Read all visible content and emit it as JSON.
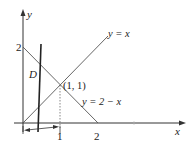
{
  "diagram": {
    "axes": {
      "x_label": "x",
      "y_label": "y",
      "x_ticks": [
        "1",
        "2"
      ],
      "y_ticks": [
        "2"
      ]
    },
    "lines": [
      {
        "name": "y = x",
        "label": "y = x"
      },
      {
        "name": "y = 2 − x",
        "label": "y = 2 − x"
      }
    ],
    "intersection_label": "(1, 1)",
    "region_label": "D",
    "colors": {
      "stroke": "#333333",
      "background": "#ffffff"
    }
  }
}
